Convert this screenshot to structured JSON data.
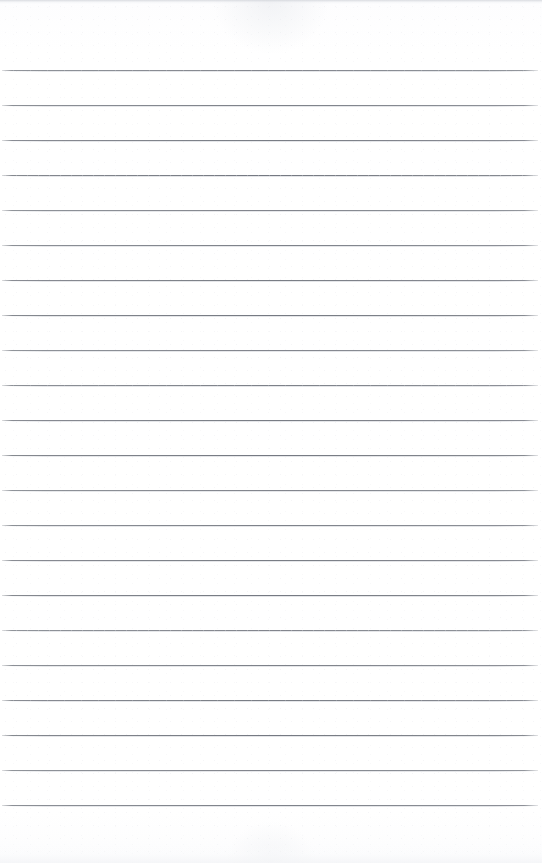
{
  "document": {
    "kind": "blank-ruled-notebook-page",
    "title": "Blank Ruled Notebook Page",
    "orientation": "portrait",
    "page_width_px": 542,
    "page_height_px": 863,
    "background_color": "#ffffff",
    "has_text_content": false,
    "text_content": "",
    "has_header": false,
    "has_footer": false,
    "has_page_number": false,
    "has_margin_rule": false,
    "has_holes": false
  },
  "ruling": {
    "style": "wide-ruled horizontal lines",
    "line_color": "#757982",
    "line_thickness_px": 1,
    "line_count": 22,
    "first_line_y_px": 70,
    "line_spacing_px": 35,
    "line_start_x_px": 2,
    "line_end_x_px": 538,
    "top_margin_px": 70,
    "bottom_margin_px": 38,
    "line_y_positions": [
      70,
      105,
      140,
      175,
      210,
      245,
      280,
      315,
      350,
      385,
      420,
      455,
      490,
      525,
      560,
      595,
      630,
      665,
      700,
      735,
      770,
      805
    ],
    "notes": "scanned sheet; faint grey scan band at the extreme top edge and a light wash at the bottom edge"
  },
  "scan_artifacts": {
    "top_edge_tint": "#cdd0d6",
    "bottom_edge_tint": "#f4f5f7",
    "speckle_tint": "#e0e2e7"
  }
}
